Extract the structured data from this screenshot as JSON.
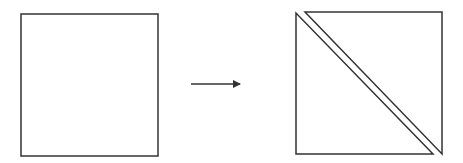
{
  "diagram": {
    "stroke_color": "#333333",
    "background": "#ffffff",
    "left_shape": {
      "type": "square",
      "x": 21,
      "y": 14,
      "width": 137,
      "height": 142
    },
    "arrow": {
      "x1": 191,
      "y1": 84,
      "x2": 246,
      "y2": 84,
      "direction": "right"
    },
    "right_shapes": [
      {
        "type": "triangle",
        "name": "lower-left-triangle",
        "points": "296,13 296,154 433,154"
      },
      {
        "type": "triangle",
        "name": "upper-right-triangle",
        "points": "305,12 442,12 442,154"
      }
    ]
  }
}
